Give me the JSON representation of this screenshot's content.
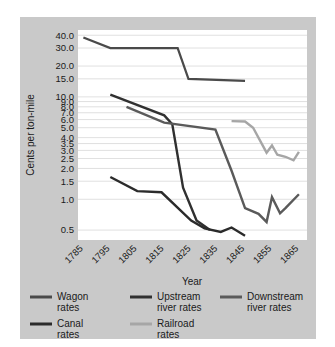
{
  "chart_data": {
    "type": "line",
    "title": "",
    "xlabel": "Year",
    "ylabel": "Cents per ton-mile",
    "yscale": "log",
    "ylim": [
      0.4,
      45.0
    ],
    "xlim": [
      1783,
      1868
    ],
    "grid": true,
    "legend_position": "bottom",
    "ytick_labels": [
      "40.0",
      "30.0",
      "20.0",
      "15.0",
      "10.0",
      "9.0",
      "8.0",
      "7.0",
      "6.0",
      "5.0",
      "4.0",
      "3.5",
      "3.0",
      "2.5",
      "2.0",
      "1.5",
      "1.0",
      "0.5"
    ],
    "ytick_values": [
      40.0,
      30.0,
      20.0,
      15.0,
      10.0,
      9.0,
      8.0,
      7.0,
      6.0,
      5.0,
      4.0,
      3.5,
      3.0,
      2.5,
      2.0,
      1.5,
      1.0,
      0.5
    ],
    "xtick_labels": [
      "1785",
      "1795",
      "1805",
      "1815",
      "1825",
      "1835",
      "1845",
      "1855",
      "1865"
    ],
    "xtick_values": [
      1785,
      1795,
      1805,
      1815,
      1825,
      1835,
      1845,
      1855,
      1865
    ],
    "series": [
      {
        "name": "Wagon rates",
        "color": "#4a4a4a",
        "width": 2.2,
        "x": [
          1785,
          1795,
          1820,
          1824,
          1845
        ],
        "values": [
          38.0,
          30.0,
          30.0,
          15.0,
          14.3
        ]
      },
      {
        "name": "Upstream river rates",
        "color": "#303030",
        "width": 2.4,
        "x": [
          1795,
          1815,
          1818,
          1822,
          1827,
          1832
        ],
        "values": [
          10.5,
          6.6,
          5.4,
          1.3,
          0.62,
          0.5
        ]
      },
      {
        "name": "Downstream river rates",
        "color": "#5a5a5a",
        "width": 2.4,
        "x": [
          1801,
          1815,
          1834,
          1840,
          1845,
          1850,
          1853,
          1855,
          1858,
          1860,
          1865
        ],
        "values": [
          8.0,
          5.6,
          4.8,
          1.9,
          0.82,
          0.72,
          0.6,
          1.05,
          0.73,
          0.82,
          1.12
        ]
      },
      {
        "name": "Canal rates",
        "color": "#2b2b2b",
        "width": 2.4,
        "x": [
          1795,
          1805,
          1814,
          1825,
          1830,
          1836,
          1840,
          1845
        ],
        "values": [
          1.65,
          1.2,
          1.17,
          0.62,
          0.52,
          0.48,
          0.53,
          0.44
        ]
      },
      {
        "name": "Railroad rates",
        "color": "#a6a6a6",
        "width": 2.4,
        "x": [
          1840,
          1845,
          1848,
          1853,
          1855,
          1857,
          1860,
          1863,
          1865
        ],
        "values": [
          5.8,
          5.75,
          5.0,
          2.85,
          3.35,
          2.72,
          2.6,
          2.4,
          2.9
        ]
      }
    ]
  },
  "legend": {
    "items": [
      {
        "label_line1": "Wagon",
        "label_line2": "rates",
        "color": "#4a4a4a"
      },
      {
        "label_line1": "Upstream",
        "label_line2": "river rates",
        "color": "#303030"
      },
      {
        "label_line1": "Downstream",
        "label_line2": "river rates",
        "color": "#5a5a5a"
      },
      {
        "label_line1": "Canal",
        "label_line2": "rates",
        "color": "#2b2b2b"
      },
      {
        "label_line1": "Railroad",
        "label_line2": "rates",
        "color": "#a6a6a6"
      }
    ]
  },
  "colors": {
    "panel_background": "#c9c9c9",
    "plot_background": "#ffffff",
    "gridline": "#d8d8d8",
    "text": "#1a1a1a"
  }
}
